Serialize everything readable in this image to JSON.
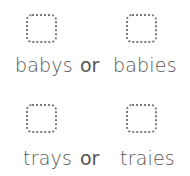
{
  "rows": [
    {
      "option_a": "babys",
      "connector": "or",
      "option_b": "babies"
    },
    {
      "option_a": "trays",
      "connector": "or",
      "option_b": "traies"
    }
  ],
  "colors": {
    "text": "#555555",
    "box_border": "#7a7a7a",
    "background": "#ffffff"
  }
}
